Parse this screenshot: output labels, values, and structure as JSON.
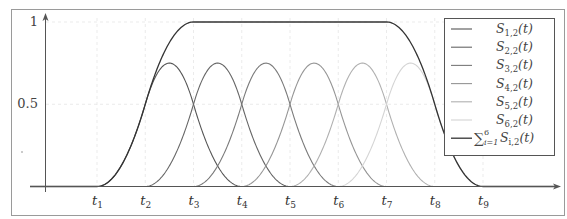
{
  "chart_data": {
    "type": "line",
    "title": "",
    "xlabel": "",
    "ylabel": "",
    "ylim": [
      0,
      1
    ],
    "y_ticks": [
      {
        "label": "1",
        "value": 1
      },
      {
        "label": "0.5",
        "value": 0.5
      }
    ],
    "x_ticks": [
      {
        "name": "t",
        "sub": "1"
      },
      {
        "name": "t",
        "sub": "2"
      },
      {
        "name": "t",
        "sub": "3"
      },
      {
        "name": "t",
        "sub": "4"
      },
      {
        "name": "t",
        "sub": "5"
      },
      {
        "name": "t",
        "sub": "6"
      },
      {
        "name": "t",
        "sub": "7"
      },
      {
        "name": "t",
        "sub": "8"
      },
      {
        "name": "t",
        "sub": "9"
      }
    ],
    "grid": true,
    "legend_position": "upper right",
    "series": [
      {
        "name": "S_{1,2}(t)",
        "label_main": "S",
        "label_sub": "1,2",
        "support": [
          1,
          4
        ],
        "peak": 0.75,
        "color": "#555555"
      },
      {
        "name": "S_{2,2}(t)",
        "label_main": "S",
        "label_sub": "2,2",
        "support": [
          2,
          5
        ],
        "peak": 0.75,
        "color": "#666666"
      },
      {
        "name": "S_{3,2}(t)",
        "label_main": "S",
        "label_sub": "3,2",
        "support": [
          3,
          6
        ],
        "peak": 0.75,
        "color": "#7a7a7a"
      },
      {
        "name": "S_{4,2}(t)",
        "label_main": "S",
        "label_sub": "4,2",
        "support": [
          4,
          7
        ],
        "peak": 0.75,
        "color": "#959595"
      },
      {
        "name": "S_{5,2}(t)",
        "label_main": "S",
        "label_sub": "5,2",
        "support": [
          5,
          8
        ],
        "peak": 0.75,
        "color": "#b0b0b0"
      },
      {
        "name": "S_{6,2}(t)",
        "label_main": "S",
        "label_sub": "6,2",
        "support": [
          6,
          9
        ],
        "peak": 0.75,
        "color": "#d4d4d4"
      },
      {
        "name": "sum_{i=1}^{6} S_{i,2}(t)",
        "label_main": "S",
        "label_sub": "i,2",
        "is_sum": true,
        "plateau": [
          3,
          7
        ],
        "plateau_value": 1,
        "support": [
          1,
          9
        ],
        "color": "#333333"
      }
    ]
  },
  "legend": {
    "sum_symbol": "∑",
    "sum_upper": "6",
    "sum_lower": "i=1",
    "arg": "(t)"
  }
}
